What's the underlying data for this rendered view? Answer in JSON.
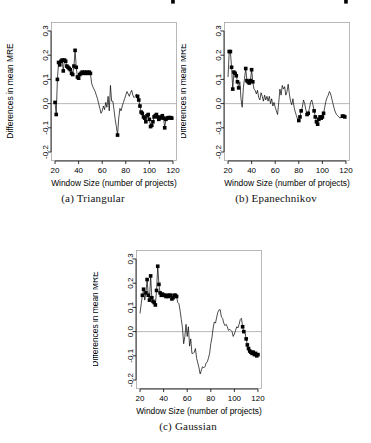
{
  "figure": {
    "title": "",
    "panels": [
      {
        "id": "a",
        "caption": "(a) Triangular",
        "caption_label": "(a)",
        "caption_name": "Triangular"
      },
      {
        "id": "b",
        "caption": "(b) Epanechnikov",
        "caption_label": "(b)",
        "caption_name": "Epanechnikov"
      },
      {
        "id": "c",
        "caption": "(c) Gaussian",
        "caption_label": "(c)",
        "caption_name": "Gaussian"
      }
    ]
  },
  "axes": {
    "xlabel": "Window Size (number of projects)",
    "ylabel": "Differences in mean MRE",
    "xticks": [
      20,
      40,
      60,
      80,
      100,
      120
    ],
    "xtick_labels": [
      "20",
      "40",
      "60",
      "80",
      "100",
      "120"
    ],
    "yticks": [
      -0.2,
      -0.1,
      0.0,
      0.1,
      0.2,
      0.3
    ],
    "ytick_labels": [
      "-0.2",
      "-0.1",
      "0.0",
      "0.1",
      "0.2",
      "0.3"
    ],
    "xlim": [
      17,
      123
    ],
    "ylim": [
      -0.235,
      0.335
    ],
    "grid": false,
    "reference_line_y": 0.0
  },
  "colors": {
    "line": "#000000",
    "point": "#000000",
    "box": "#9a9a9a",
    "reference": "#9a9a9a",
    "background": "#ffffff"
  },
  "chart_data": [
    {
      "type": "line",
      "panel": "a",
      "title": "(a) Triangular",
      "xlabel": "Window Size (number of projects)",
      "ylabel": "Differences in mean MRE",
      "xlim": [
        17,
        123
      ],
      "ylim": [
        -0.235,
        0.335
      ],
      "grid": false,
      "legend": null,
      "marker": "filled-square",
      "x": [
        20,
        21,
        22,
        23,
        24,
        25,
        26,
        27,
        28,
        29,
        30,
        31,
        32,
        33,
        34,
        35,
        36,
        37,
        38,
        39,
        40,
        41,
        42,
        43,
        44,
        45,
        46,
        47,
        48,
        49,
        50,
        51,
        52,
        53,
        54,
        55,
        56,
        57,
        58,
        59,
        60,
        61,
        62,
        63,
        64,
        65,
        66,
        67,
        68,
        69,
        70,
        71,
        72,
        73,
        74,
        75,
        76,
        77,
        78,
        79,
        80,
        81,
        82,
        83,
        84,
        85,
        86,
        87,
        88,
        89,
        90,
        91,
        92,
        93,
        94,
        95,
        96,
        97,
        98,
        99,
        100,
        101,
        102,
        103,
        104,
        105,
        106,
        107,
        108,
        109,
        110,
        111,
        112,
        113,
        114,
        115,
        116,
        117,
        118,
        119,
        120
      ],
      "y": [
        0.005,
        -0.045,
        0.1,
        0.17,
        0.16,
        0.175,
        0.18,
        0.135,
        0.18,
        0.175,
        0.155,
        0.15,
        0.145,
        0.14,
        0.125,
        0.12,
        0.155,
        0.22,
        0.15,
        0.11,
        0.105,
        0.12,
        0.125,
        0.13,
        0.125,
        0.13,
        0.125,
        0.13,
        0.125,
        0.13,
        0.125,
        0.085,
        0.07,
        0.06,
        0.05,
        0.035,
        0.02,
        0.0,
        -0.02,
        -0.04,
        -0.03,
        -0.01,
        -0.025,
        0.005,
        -0.015,
        0.03,
        -0.03,
        0.075,
        0.01,
        0.01,
        -0.025,
        -0.065,
        -0.095,
        -0.13,
        -0.06,
        -0.02,
        -0.03,
        -0.01,
        0.005,
        0.02,
        0.035,
        0.05,
        0.04,
        0.03,
        0.045,
        0.055,
        0.035,
        0.025,
        0.03,
        0.04,
        0.03,
        0.015,
        -0.01,
        -0.035,
        -0.04,
        -0.055,
        -0.06,
        -0.075,
        -0.05,
        -0.045,
        -0.065,
        -0.095,
        -0.09,
        -0.075,
        -0.055,
        -0.05,
        -0.045,
        -0.055,
        -0.065,
        -0.06,
        -0.055,
        -0.05,
        -0.06,
        -0.1,
        -0.065,
        -0.06,
        -0.058,
        -0.058,
        -0.058,
        -0.06
      ],
      "marked_points_x": [
        20,
        21,
        22,
        23,
        24,
        25,
        26,
        27,
        28,
        29,
        30,
        31,
        32,
        33,
        34,
        35,
        36,
        37,
        38,
        39,
        40,
        41,
        42,
        43,
        44,
        45,
        46,
        47,
        48,
        49,
        50,
        73,
        90,
        91,
        92,
        93,
        94,
        95,
        96,
        97,
        98,
        99,
        100,
        101,
        102,
        103,
        104,
        105,
        106,
        107,
        108,
        109,
        110,
        111,
        112,
        113,
        114,
        115,
        116,
        117,
        118,
        119,
        120
      ]
    },
    {
      "type": "line",
      "panel": "b",
      "title": "(b) Epanechnikov",
      "xlabel": "Window Size (number of projects)",
      "ylabel": "Differences in mean MRE",
      "xlim": [
        17,
        123
      ],
      "ylim": [
        -0.235,
        0.335
      ],
      "grid": false,
      "legend": null,
      "marker": "filled-square",
      "x": [
        20,
        21,
        22,
        23,
        24,
        25,
        26,
        27,
        28,
        29,
        30,
        31,
        32,
        33,
        34,
        35,
        36,
        37,
        38,
        39,
        40,
        41,
        42,
        43,
        44,
        45,
        46,
        47,
        48,
        49,
        50,
        51,
        52,
        53,
        54,
        55,
        56,
        57,
        58,
        59,
        60,
        61,
        62,
        63,
        64,
        65,
        66,
        67,
        68,
        69,
        70,
        71,
        72,
        73,
        74,
        75,
        76,
        77,
        78,
        79,
        80,
        81,
        82,
        83,
        84,
        85,
        86,
        87,
        88,
        89,
        90,
        91,
        92,
        93,
        94,
        95,
        96,
        97,
        98,
        99,
        100,
        101,
        102,
        103,
        104,
        105,
        106,
        107,
        108,
        109,
        110,
        111,
        112,
        113,
        114,
        115,
        116,
        117,
        118,
        119,
        120
      ],
      "y": [
        0.11,
        0.215,
        0.215,
        0.15,
        0.06,
        0.13,
        0.125,
        0.115,
        0.09,
        0.065,
        0.09,
        0.02,
        -0.015,
        0.065,
        0.105,
        0.145,
        0.095,
        0.09,
        0.085,
        0.095,
        0.14,
        0.09,
        0.06,
        0.055,
        0.04,
        0.055,
        0.025,
        0.015,
        0.045,
        0.03,
        0.01,
        0.035,
        0.015,
        0.03,
        0.01,
        0.03,
        0.0,
        0.02,
        -0.01,
        0.005,
        -0.015,
        -0.03,
        -0.045,
        0.005,
        0.06,
        0.035,
        0.075,
        0.06,
        0.07,
        0.035,
        0.05,
        0.08,
        0.04,
        0.01,
        -0.005,
        0.02,
        -0.015,
        -0.035,
        -0.05,
        -0.065,
        -0.07,
        -0.055,
        -0.03,
        -0.015,
        0.015,
        0.0,
        -0.025,
        -0.045,
        -0.04,
        -0.02,
        0.005,
        0.015,
        -0.005,
        -0.03,
        -0.055,
        -0.075,
        -0.085,
        -0.065,
        -0.055,
        -0.06,
        -0.055,
        -0.04,
        -0.015,
        0.01,
        0.025,
        0.035,
        0.05,
        0.04,
        0.02,
        0.0,
        -0.02,
        -0.035,
        -0.045,
        -0.05,
        -0.055,
        -0.06,
        -0.055,
        -0.052,
        -0.052,
        -0.055
      ],
      "marked_points_x": [
        21,
        22,
        23,
        24,
        25,
        26,
        27,
        28,
        29,
        35,
        36,
        37,
        38,
        39,
        40,
        41,
        80,
        81,
        82,
        87,
        88,
        93,
        94,
        95,
        96,
        97,
        98,
        99,
        100,
        101,
        117,
        118,
        119,
        120
      ]
    },
    {
      "type": "line",
      "panel": "c",
      "title": "(c) Gaussian",
      "xlabel": "Window Size (number of projects)",
      "ylabel": "Differences in mean MRE",
      "xlim": [
        17,
        123
      ],
      "ylim": [
        -0.235,
        0.335
      ],
      "grid": false,
      "legend": null,
      "marker": "filled-square",
      "x": [
        20,
        21,
        22,
        23,
        24,
        25,
        26,
        27,
        28,
        29,
        30,
        31,
        32,
        33,
        34,
        35,
        36,
        37,
        38,
        39,
        40,
        41,
        42,
        43,
        44,
        45,
        46,
        47,
        48,
        49,
        50,
        51,
        52,
        53,
        54,
        55,
        56,
        57,
        58,
        59,
        60,
        61,
        62,
        63,
        64,
        65,
        66,
        67,
        68,
        69,
        70,
        71,
        72,
        73,
        74,
        75,
        76,
        77,
        78,
        79,
        80,
        81,
        82,
        83,
        84,
        85,
        86,
        87,
        88,
        89,
        90,
        91,
        92,
        93,
        94,
        95,
        96,
        97,
        98,
        99,
        100,
        101,
        102,
        103,
        104,
        105,
        106,
        107,
        108,
        109,
        110,
        111,
        112,
        113,
        114,
        115,
        116,
        117,
        118,
        119,
        120
      ],
      "y": [
        0.075,
        0.115,
        0.15,
        0.175,
        0.13,
        0.16,
        0.215,
        0.15,
        0.13,
        0.23,
        0.14,
        0.125,
        0.12,
        0.11,
        0.17,
        0.27,
        0.195,
        0.16,
        0.15,
        0.155,
        0.15,
        0.15,
        0.145,
        0.15,
        0.145,
        0.15,
        0.15,
        0.135,
        0.14,
        0.15,
        0.15,
        0.145,
        0.12,
        0.115,
        0.085,
        0.05,
        0.015,
        -0.05,
        -0.02,
        0.03,
        -0.02,
        0.02,
        -0.06,
        -0.03,
        -0.09,
        -0.09,
        -0.085,
        -0.07,
        -0.11,
        -0.13,
        -0.15,
        -0.175,
        -0.16,
        -0.145,
        -0.15,
        -0.145,
        -0.13,
        -0.125,
        -0.11,
        -0.09,
        -0.05,
        -0.025,
        0.015,
        0.04,
        0.035,
        0.06,
        0.08,
        0.09,
        0.09,
        0.06,
        0.055,
        0.035,
        0.025,
        0.03,
        0.02,
        0.005,
        0.01,
        0.005,
        0.0,
        -0.02,
        -0.01,
        0.005,
        0.02,
        0.015,
        0.03,
        0.05,
        0.055,
        0.02,
        0.0,
        -0.005,
        -0.03,
        -0.055,
        -0.07,
        -0.08,
        -0.085,
        -0.09,
        -0.085,
        -0.095,
        -0.09,
        -0.1,
        -0.095,
        -0.1
      ],
      "marked_points_x": [
        22,
        23,
        25,
        26,
        27,
        28,
        29,
        30,
        31,
        32,
        33,
        34,
        35,
        36,
        37,
        38,
        39,
        40,
        41,
        42,
        43,
        44,
        45,
        46,
        47,
        48,
        49,
        50,
        51,
        107,
        108,
        110,
        111,
        112,
        113,
        114,
        115,
        116,
        117,
        118,
        119,
        120
      ]
    }
  ]
}
